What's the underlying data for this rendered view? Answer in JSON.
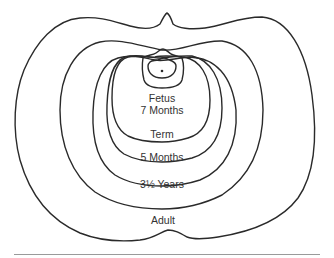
{
  "diagram": {
    "title": "",
    "type": "growth contour diagram",
    "stroke_color": "#2a2a2a",
    "baseline_color": "#9a9a9a",
    "labels": [
      {
        "id": "fetus",
        "text": "Fetus",
        "x": 162,
        "y": 98
      },
      {
        "id": "seven-months",
        "text": "7 Months",
        "x": 162,
        "y": 110
      },
      {
        "id": "term",
        "text": "Term",
        "x": 162,
        "y": 134
      },
      {
        "id": "five-months",
        "text": "5 Months",
        "x": 162,
        "y": 157
      },
      {
        "id": "three-half-years",
        "text": "3½ Years",
        "x": 162,
        "y": 184
      },
      {
        "id": "adult",
        "text": "Adult",
        "x": 163,
        "y": 220
      }
    ],
    "contours": [
      "Adult",
      "3½ Years",
      "5 Months",
      "Term",
      "Fetus 7 Months",
      "Early fetus"
    ]
  }
}
